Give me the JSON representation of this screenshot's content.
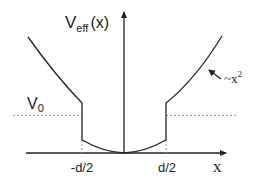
{
  "diagram": {
    "y_axis_label": "V",
    "y_axis_label_sub": "eff",
    "y_axis_label_arg": "(x)",
    "x_axis_label": "x",
    "v0_label": "V",
    "v0_sub": "0",
    "left_tick": "-d/2",
    "right_tick": "d/2",
    "annotation_tilde": "~x",
    "annotation_exp": "2"
  },
  "colors": {
    "line": "#222222",
    "dotted": "#999999",
    "background": "#ffffff"
  }
}
